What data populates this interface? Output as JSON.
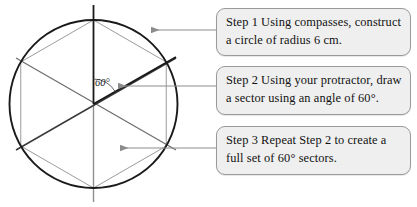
{
  "figure": {
    "circle": {
      "center_x": 93.5,
      "center_y": 104,
      "radius": 84,
      "stroke": "#1a1a1a"
    },
    "angle_marker": {
      "label": "60°",
      "value_degrees": 60,
      "from_degrees": 90,
      "to_degrees": 30
    },
    "hexagon": {
      "sides": 6,
      "vertex_angles_degrees": [
        90,
        30,
        -30,
        -90,
        -150,
        150
      ],
      "edge_stroke": "#9b9b9b"
    },
    "diameters": [
      {
        "angle_degrees": 90,
        "stroke": "#8e8e8e"
      },
      {
        "angle_degrees": 30,
        "stroke": "#3a3a3a"
      },
      {
        "angle_degrees": 150,
        "stroke": "#6f6f6f"
      }
    ],
    "highlighted_radii": [
      {
        "angle_degrees": 90,
        "stroke": "#1a1a1a"
      },
      {
        "angle_degrees": 30,
        "stroke": "#1a1a1a"
      }
    ]
  },
  "callouts": [
    {
      "id": "step-1",
      "line1": "Step 1 Using compasses, construct",
      "line2": "a circle of radius 6 cm.",
      "pointer": {
        "x1": 216,
        "y1": 30,
        "x2": 150,
        "y2": 30
      }
    },
    {
      "id": "step-2",
      "line1": "Step 2 Using your protractor, draw",
      "line2": "a sector using an angle of 60°.",
      "pointer": {
        "x1": 216,
        "y1": 86,
        "x2": 117,
        "y2": 86
      }
    },
    {
      "id": "step-3",
      "line1": "Step 3 Repeat Step 2 to create a",
      "line2": "full set of 60° sectors.",
      "pointer": {
        "x1": 216,
        "y1": 148,
        "x2": 119,
        "y2": 148
      }
    }
  ],
  "colors": {
    "box_fill": "#efefef",
    "box_border": "#9a9a9a",
    "arrow": "#8c8c8c",
    "ink_dark": "#1a1a1a",
    "ink_light": "#9b9b9b"
  }
}
